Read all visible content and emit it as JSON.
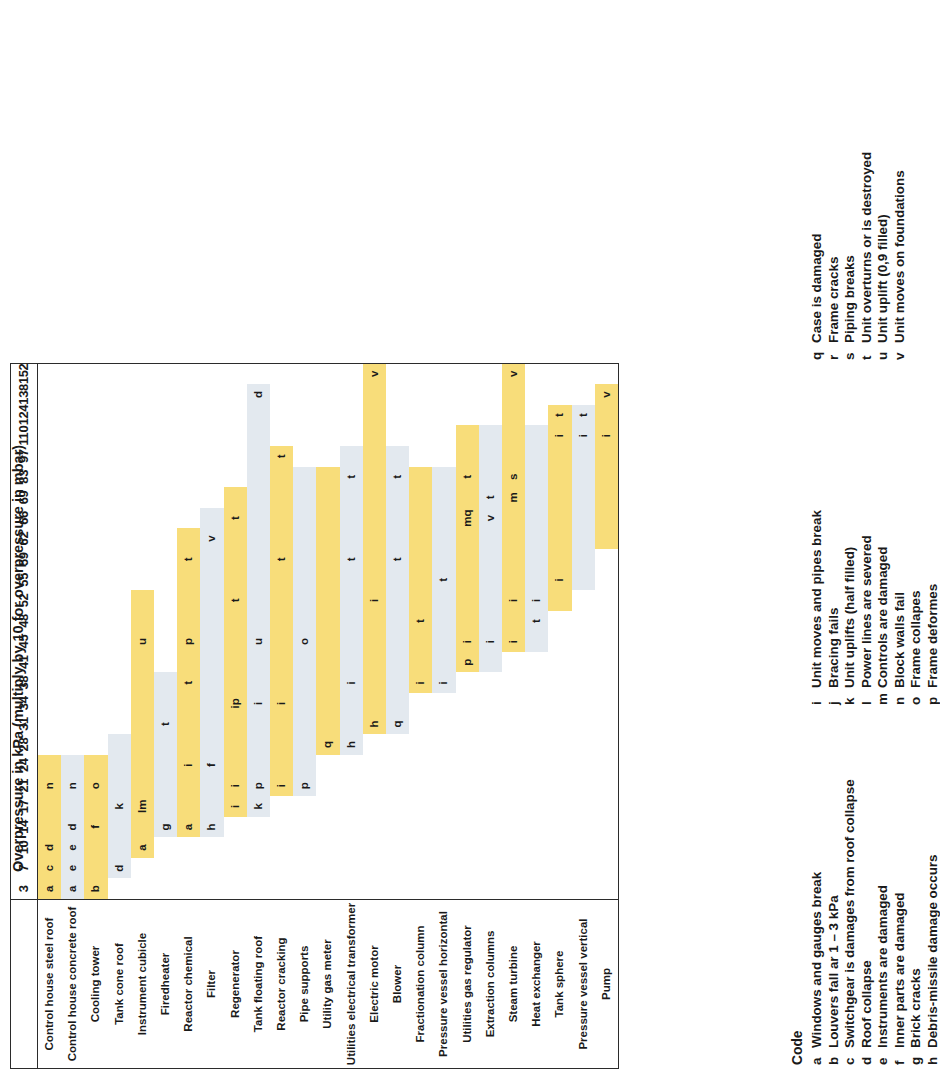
{
  "chart_data": {
    "type": "table",
    "title": "Overpressure in kPa (multiply by 10 for overpressure in mbar)",
    "xlabel": "Overpressure in kPa",
    "ylabel": "Equipment",
    "categories": [
      "3",
      "7",
      "10",
      "14",
      "17",
      "21",
      "24",
      "28",
      "31",
      "34",
      "38",
      "41",
      "45",
      "48",
      "52",
      "55",
      "59",
      "62",
      "66",
      "69",
      "83",
      "97",
      "110",
      "124",
      "138",
      "152"
    ],
    "row_labels": [
      "Control house steel roof",
      "Control house concrete roof",
      "Cooling tower",
      "Tank cone roof",
      "Instrument cubicle",
      "Firedheater",
      "Reactor chemical",
      "Filter",
      "Regenerator",
      "Tank floating roof",
      "Reactor cracking",
      "Pipe supports",
      "Utility gas meter",
      "Utilities electrical transformer",
      "Electric motor",
      "Blower",
      "Fractionation column",
      "Pressure vessel horizontal",
      "Utilities gas regulator",
      "Extraction columns",
      "Steam turbine",
      "Heat exchanger",
      "Tank sphere",
      "Pressure vessel vertical",
      "Pump"
    ],
    "row_band": [
      "y",
      "b",
      "y",
      "b",
      "y",
      "b",
      "y",
      "b",
      "y",
      "b",
      "y",
      "b",
      "y",
      "b",
      "y",
      "b",
      "y",
      "b",
      "y",
      "b",
      "y",
      "b",
      "y",
      "b",
      "y"
    ],
    "rows": [
      {
        "label": "Control house steel roof",
        "band": "y",
        "bar_from": "3",
        "bar_to": "24",
        "cells": {
          "3": "a",
          "7": "c",
          "10": "d",
          "21": "n"
        }
      },
      {
        "label": "Control house concrete roof",
        "band": "b",
        "bar_from": "3",
        "bar_to": "24",
        "cells": {
          "3": "a",
          "7": "e",
          "10": "e",
          "14": "d",
          "21": "n"
        }
      },
      {
        "label": "Cooling tower",
        "band": "y",
        "bar_from": "3",
        "bar_to": "24",
        "cells": {
          "3": "b",
          "14": "f",
          "21": "o"
        }
      },
      {
        "label": "Tank cone roof",
        "band": "b",
        "bar_from": "7",
        "bar_to": "28",
        "cells": {
          "7": "d",
          "17": "k"
        }
      },
      {
        "label": "Instrument cubicle",
        "band": "y",
        "bar_from": "10",
        "bar_to": "52",
        "cells": {
          "10": "a",
          "17": "lm",
          "45": "u"
        }
      },
      {
        "label": "Firedheater",
        "band": "b",
        "bar_from": "14",
        "bar_to": "38",
        "cells": {
          "14": "g",
          "31": "t"
        }
      },
      {
        "label": "Reactor chemical",
        "band": "y",
        "bar_from": "14",
        "bar_to": "62",
        "cells": {
          "14": "a",
          "24": "i",
          "38": "t",
          "45": "p",
          "59": "t"
        }
      },
      {
        "label": "Filter",
        "band": "b",
        "bar_from": "14",
        "bar_to": "66",
        "cells": {
          "14": "h",
          "24": "f",
          "62": "v"
        }
      },
      {
        "label": "Regenerator",
        "band": "y",
        "bar_from": "17",
        "bar_to": "69",
        "cells": {
          "17": "i",
          "21": "i",
          "34": "ip",
          "52": "t",
          "66": "t"
        }
      },
      {
        "label": "Tank floating roof",
        "band": "b",
        "bar_from": "17",
        "bar_to": "138",
        "cells": {
          "17": "k",
          "21": "p",
          "34": "i",
          "45": "u",
          "138": "d"
        }
      },
      {
        "label": "Reactor cracking",
        "band": "y",
        "bar_from": "21",
        "bar_to": "97",
        "cells": {
          "21": "i",
          "34": "i",
          "59": "t",
          "97": "t"
        }
      },
      {
        "label": "Pipe supports",
        "band": "b",
        "bar_from": "21",
        "bar_to": "83",
        "cells": {
          "21": "p",
          "45": "o"
        }
      },
      {
        "label": "Utility gas meter",
        "band": "y",
        "bar_from": "28",
        "bar_to": "83",
        "cells": {
          "28": "q"
        }
      },
      {
        "label": "Utilities electrical transformer",
        "band": "b",
        "bar_from": "28",
        "bar_to": "97",
        "cells": {
          "28": "h",
          "38": "i",
          "59": "t",
          "83": "t"
        }
      },
      {
        "label": "Electric motor",
        "band": "y",
        "bar_from": "31",
        "bar_to": "152",
        "cells": {
          "31": "h",
          "52": "i",
          "152": "v"
        }
      },
      {
        "label": "Blower",
        "band": "b",
        "bar_from": "31",
        "bar_to": "97",
        "cells": {
          "31": "q",
          "59": "t",
          "83": "t"
        }
      },
      {
        "label": "Fractionation column",
        "band": "y",
        "bar_from": "38",
        "bar_to": "83",
        "cells": {
          "38": "i",
          "48": "t"
        }
      },
      {
        "label": "Pressure vessel horizontal",
        "band": "b",
        "bar_from": "38",
        "bar_to": "83",
        "cells": {
          "38": "i",
          "55": "t"
        }
      },
      {
        "label": "Utilities gas regulator",
        "band": "y",
        "bar_from": "41",
        "bar_to": "110",
        "cells": {
          "41": "p",
          "45": "i",
          "66": "mq",
          "83": "t"
        }
      },
      {
        "label": "Extraction columns",
        "band": "b",
        "bar_from": "41",
        "bar_to": "110",
        "cells": {
          "45": "i",
          "66": "v",
          "69": "t"
        }
      },
      {
        "label": "Steam turbine",
        "band": "y",
        "bar_from": "45",
        "bar_to": "152",
        "cells": {
          "45": "i",
          "52": "i",
          "69": "m",
          "83": "s",
          "152": "v"
        }
      },
      {
        "label": "Heat exchanger",
        "band": "b",
        "bar_from": "45",
        "bar_to": "110",
        "cells": {
          "48": "t",
          "52": "i"
        }
      },
      {
        "label": "Tank sphere",
        "band": "y",
        "bar_from": "52",
        "bar_to": "124",
        "cells": {
          "55": "i",
          "110": "i",
          "124": "t"
        }
      },
      {
        "label": "Pressure vessel vertical",
        "band": "b",
        "bar_from": "55",
        "bar_to": "124",
        "cells": {
          "110": "i",
          "124": "t"
        }
      },
      {
        "label": "Pump",
        "band": "y",
        "bar_from": "62",
        "bar_to": "138",
        "cells": {
          "110": "i",
          "138": "v"
        }
      }
    ]
  },
  "header": {
    "title": "Overpressure in kPa (multiply by 10 for overpressure in mbar)"
  },
  "legend": {
    "heading": "Code",
    "col1": [
      {
        "key": "a",
        "text": "Windows and gauges break"
      },
      {
        "key": "b",
        "text": "Louvers fall ar 1 – 3 kPa"
      },
      {
        "key": "c",
        "text": "Switchgear is damages from roof collapse"
      },
      {
        "key": "d",
        "text": "Roof collapse"
      },
      {
        "key": "e",
        "text": "Instruments are damaged"
      },
      {
        "key": "f",
        "text": "Inner parts are damaged"
      },
      {
        "key": "g",
        "text": "Brick cracks"
      },
      {
        "key": "h",
        "text": "Debris-missile damage occurs"
      }
    ],
    "col2": [
      {
        "key": "i",
        "text": "Unit moves and pipes break"
      },
      {
        "key": "j",
        "text": "Bracing fails"
      },
      {
        "key": "k",
        "text": "Unit uplifts (half filled)"
      },
      {
        "key": "l",
        "text": "Power lines are severed"
      },
      {
        "key": "m",
        "text": "Controls are damaged"
      },
      {
        "key": "n",
        "text": "Block walls fail"
      },
      {
        "key": "o",
        "text": "Frame collapes"
      },
      {
        "key": "p",
        "text": "Frame deformes"
      }
    ],
    "col3": [
      {
        "key": "q",
        "text": "Case is damaged"
      },
      {
        "key": "r",
        "text": "Frame cracks"
      },
      {
        "key": "s",
        "text": "Piping breaks"
      },
      {
        "key": "t",
        "text": "Unit overturns or is destroyed"
      },
      {
        "key": "u",
        "text": "Unit uplift (0,9 filled)"
      },
      {
        "key": "v",
        "text": "Unit moves on foundations"
      }
    ]
  },
  "colors": {
    "band_yellow": "#f8dd7a",
    "band_blue": "#e3e9ef",
    "border": "#2b2b2b",
    "text": "#1a1a1a"
  }
}
